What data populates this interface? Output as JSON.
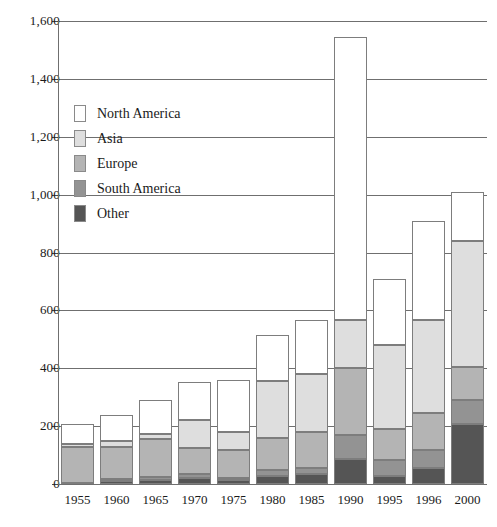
{
  "chart_data": {
    "type": "bar",
    "stacked": true,
    "title": "",
    "xlabel": "",
    "ylabel": "",
    "ylim": [
      0,
      1600
    ],
    "ytick_step": 200,
    "grid": true,
    "legend_position": "inside-upper-left",
    "categories": [
      "1955",
      "1960",
      "1965",
      "1970",
      "1975",
      "1980",
      "1985",
      "1990",
      "1995",
      "1996",
      "2000"
    ],
    "ytick_labels": [
      "1,600",
      "1,400",
      "1,200",
      "1,000",
      "800",
      "600",
      "400",
      "200",
      "0"
    ],
    "ytick_values": [
      1600,
      1400,
      1200,
      1000,
      800,
      600,
      400,
      200,
      0
    ],
    "series": [
      {
        "name": "North America",
        "color": "#ffffff",
        "values": [
          70,
          89,
          120,
          131,
          179,
          159,
          186,
          979,
          228,
          342,
          169
        ]
      },
      {
        "name": "Asia",
        "color": "#dedede",
        "values": [
          8,
          21,
          17,
          97,
          62,
          197,
          201,
          166,
          290,
          321,
          436
        ]
      },
      {
        "name": "Europe",
        "color": "#b4b4b4",
        "values": [
          124,
          111,
          131,
          90,
          97,
          111,
          124,
          231,
          107,
          127,
          114
        ]
      },
      {
        "name": "South America",
        "color": "#939393",
        "values": [
          0,
          7,
          10,
          14,
          7,
          21,
          21,
          83,
          55,
          62,
          83
        ]
      },
      {
        "name": "Other",
        "color": "#555555",
        "values": [
          5,
          10,
          14,
          21,
          14,
          28,
          35,
          86,
          28,
          56,
          207
        ]
      }
    ],
    "totals": [
      207,
      238,
      292,
      353,
      359,
      516,
      567,
      1545,
      708,
      908,
      1009
    ]
  }
}
